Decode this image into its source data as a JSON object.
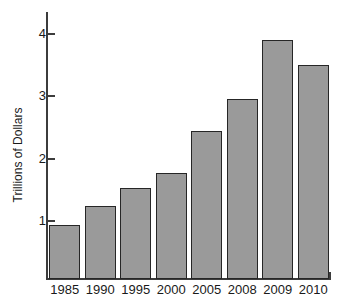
{
  "chart_data": {
    "type": "bar",
    "title": "",
    "xlabel": "",
    "ylabel": "Trillions of Dollars",
    "categories": [
      "1985",
      "1990",
      "1995",
      "2000",
      "2005",
      "2008",
      "2009",
      "2010"
    ],
    "values": [
      0.95,
      1.25,
      1.53,
      1.78,
      2.44,
      2.96,
      3.91,
      3.51
    ],
    "ylim": [
      0.08,
      4.35
    ],
    "yticks": [
      1,
      2,
      3,
      4
    ],
    "ytick_labels": [
      "1",
      "2",
      "3",
      "4"
    ],
    "grid": false,
    "legend": false,
    "bar_fill_color": "#9a9a9a",
    "bar_border_color": "#262626",
    "axis_color": "#3c3c3c",
    "background_color": "#ffffff"
  }
}
